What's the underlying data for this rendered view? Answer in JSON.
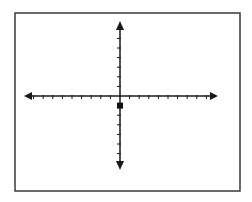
{
  "diagram": {
    "type": "coordinate-plane",
    "frame": {
      "x": 15,
      "y": 13,
      "width": 225,
      "height": 178,
      "stroke": "#3a3a3a"
    },
    "origin": {
      "px": 120,
      "py": 96
    },
    "tick_spacing_px": 9.6,
    "x_axis": {
      "x_start": 24,
      "x_end": 218,
      "ticks_left": 10,
      "ticks_right": 10,
      "arrows": [
        "left",
        "right"
      ]
    },
    "y_axis": {
      "y_start": 21,
      "y_end": 170,
      "ticks_up": 7,
      "ticks_down": 7,
      "arrows": [
        "up",
        "down"
      ]
    },
    "axis_color": "#1a1a1a",
    "points": [
      {
        "label": "",
        "x": 0,
        "y": -1,
        "marker": "square",
        "color": "#111111"
      }
    ]
  },
  "chart_data": {
    "type": "scatter",
    "title": "",
    "xlabel": "",
    "ylabel": "",
    "x": [
      0
    ],
    "y": [
      -1
    ],
    "xlim": [
      -10,
      10
    ],
    "ylim": [
      -7,
      7
    ],
    "grid": false,
    "legend": "none"
  }
}
